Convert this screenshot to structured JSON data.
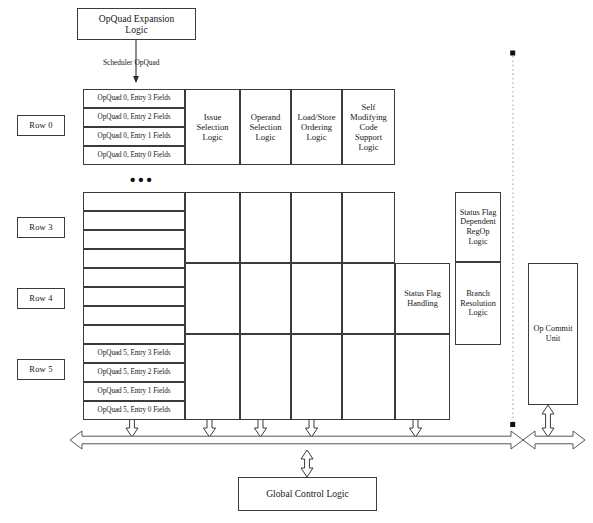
{
  "diagram": {
    "colors": {
      "stroke": "#3b3b3b",
      "fill": "#ffffff",
      "text": "#171717",
      "dotted": "#8a8a8a"
    }
  },
  "top": {
    "expansion_logic": "OpQuad Expansion\nLogic",
    "flow_label": "Scheduler OpQuad"
  },
  "row_labels": [
    {
      "id": "row-0",
      "label": "Row 0"
    },
    {
      "id": "row-3",
      "label": "Row 3"
    },
    {
      "id": "row-4",
      "label": "Row 4"
    },
    {
      "id": "row-5",
      "label": "Row 5"
    }
  ],
  "ellipsis": "•••",
  "entries": {
    "row0": [
      "OpQuad 0, Entry 3 Fields",
      "OpQuad 0, Entry 2 Fields",
      "OpQuad 0, Entry 1 Fields",
      "OpQuad 0, Entry 0 Fields"
    ],
    "row5": [
      "OpQuad 5, Entry 3 Fields",
      "OpQuad 5, Entry 2 Fields",
      "OpQuad 5, Entry 1 Fields",
      "OpQuad 5, Entry 0 Fields"
    ],
    "blank_row_count": 8
  },
  "logic_columns": [
    {
      "id": "issue-selection",
      "label": "Issue\nSelection\nLogic"
    },
    {
      "id": "operand-selection",
      "label": "Operand\nSelection\nLogic"
    },
    {
      "id": "load-store-ordering",
      "label": "Load/Store\nOrdering\nLogic"
    },
    {
      "id": "self-modifying-code",
      "label": "Self\nModifying\nCode\nSupport\nLogic"
    }
  ],
  "blocks": {
    "status_flag_handling": "Status Flag\nHandling",
    "status_flag_dependent": "Status Flag\nDependent\nRegOp\nLogic",
    "branch_resolution": "Branch\nResolution\nLogic",
    "op_commit_unit": "Op Commit\nUnit",
    "global_control_logic": "Global Control Logic"
  }
}
